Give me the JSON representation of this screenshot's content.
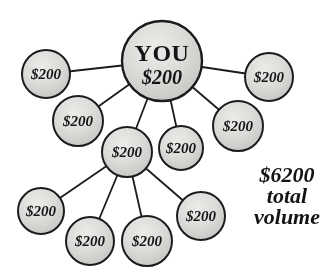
{
  "colors": {
    "background": "#ffffff",
    "node_fill_light": "#f2f2f0",
    "node_fill_mid": "#dfdfdd",
    "node_fill_dark": "#c7c7c5",
    "outline": "#1c1c1c",
    "text": "#141414"
  },
  "diagram": {
    "root": {
      "name": "YOU",
      "amount": "$200"
    },
    "nodes": [
      {
        "label": "$200"
      },
      {
        "label": "$200"
      },
      {
        "label": "$200"
      },
      {
        "label": "$200"
      },
      {
        "label": "$200"
      },
      {
        "label": "$200"
      },
      {
        "label": "$200"
      },
      {
        "label": "$200"
      },
      {
        "label": "$200"
      },
      {
        "label": "$200"
      }
    ],
    "annotation": {
      "lines": [
        "$6200",
        "total",
        "volume"
      ]
    }
  }
}
